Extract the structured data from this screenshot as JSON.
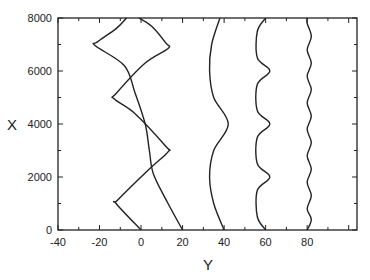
{
  "chart_data": {
    "type": "line",
    "title": "",
    "xlabel": "Y",
    "ylabel": "X",
    "xlim": [
      -40,
      104
    ],
    "ylim": [
      0,
      8000
    ],
    "x_ticks": [
      -40,
      -20,
      0,
      20,
      40,
      60,
      80
    ],
    "x_tick_labels": [
      "-40",
      "-20",
      "0",
      "20",
      "40",
      "60",
      "80"
    ],
    "y_ticks": [
      0,
      2000,
      4000,
      6000,
      8000
    ],
    "y_tick_labels": [
      "0",
      "2000",
      "4000",
      "6000",
      "8000"
    ],
    "grid": false,
    "legend": null,
    "series": [
      {
        "name": "zigzag-1",
        "points": [
          [
            0,
            0
          ],
          [
            -12,
            1000
          ],
          [
            -11,
            1150
          ],
          [
            4,
            2300
          ],
          [
            13,
            2950
          ],
          [
            12,
            3150
          ],
          [
            -3,
            4400
          ],
          [
            -13,
            4950
          ],
          [
            -12,
            5150
          ],
          [
            2,
            6300
          ],
          [
            13,
            6850
          ],
          [
            12,
            7050
          ],
          [
            5,
            7700
          ],
          [
            -1,
            8000
          ]
        ]
      },
      {
        "name": "zigzag-2",
        "points": [
          [
            20,
            0
          ],
          [
            13,
            1000
          ],
          [
            6,
            2100
          ],
          [
            4,
            3000
          ],
          [
            2,
            4000
          ],
          [
            -3,
            5200
          ],
          [
            -8,
            6200
          ],
          [
            -22,
            6950
          ],
          [
            -21,
            7100
          ],
          [
            -12,
            7600
          ],
          [
            -7,
            8000
          ]
        ]
      },
      {
        "name": "arc-long",
        "points": [
          [
            40,
            0
          ],
          [
            35,
            1000
          ],
          [
            33,
            2000
          ],
          [
            35,
            3000
          ],
          [
            42,
            4000
          ],
          [
            35,
            5000
          ],
          [
            33,
            6000
          ],
          [
            34,
            7000
          ],
          [
            38,
            8000
          ]
        ]
      },
      {
        "name": "arc-medium",
        "points": [
          [
            60,
            0
          ],
          [
            56,
            500
          ],
          [
            56,
            1500
          ],
          [
            62,
            2000
          ],
          [
            56,
            2500
          ],
          [
            56,
            3500
          ],
          [
            62,
            4000
          ],
          [
            56,
            4500
          ],
          [
            56,
            5500
          ],
          [
            62,
            6000
          ],
          [
            56,
            6500
          ],
          [
            56,
            7500
          ],
          [
            60,
            8000
          ]
        ]
      },
      {
        "name": "arc-short",
        "points": [
          [
            80,
            0
          ],
          [
            82,
            400
          ],
          [
            80,
            800
          ],
          [
            82,
            1300
          ],
          [
            80,
            1800
          ],
          [
            82,
            2300
          ],
          [
            80,
            2800
          ],
          [
            82,
            3300
          ],
          [
            80,
            3800
          ],
          [
            82,
            4300
          ],
          [
            80,
            4800
          ],
          [
            82,
            5300
          ],
          [
            80,
            5800
          ],
          [
            82,
            6300
          ],
          [
            80,
            6800
          ],
          [
            82,
            7300
          ],
          [
            80,
            7800
          ],
          [
            80,
            8000
          ]
        ]
      }
    ]
  }
}
